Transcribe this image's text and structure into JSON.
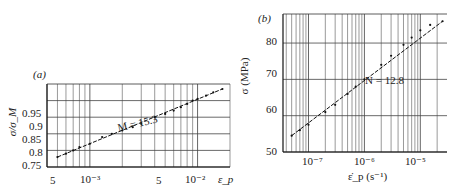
{
  "chart_data": [
    {
      "panel_label": "(a)",
      "type": "scatter",
      "xscale": "log",
      "xlabel": "ε_p",
      "ylabel": "σ/σ_M",
      "xlim": [
        0.0004,
        0.02
      ],
      "ylim": [
        0.75,
        1.0
      ],
      "xtick_labels": [
        "5",
        "10⁻³",
        "5",
        "10⁻²"
      ],
      "xtick_values": [
        0.0005,
        0.001,
        0.005,
        0.01
      ],
      "ytick_labels": [
        "0.75",
        "0.8",
        "0.85",
        "0.9",
        "0.95"
      ],
      "ytick_values": [
        0.75,
        0.8,
        0.85,
        0.9,
        0.95
      ],
      "grid": true,
      "annotation": "M = 15.3",
      "fit_line": {
        "x": [
          0.0005,
          0.017
        ],
        "y": [
          0.78,
          0.985
        ]
      },
      "series": [
        {
          "name": "data",
          "note": "approximate, sampled along fitted line at ~±0.01 precision",
          "x": [
            0.0005,
            0.0006,
            0.0007,
            0.0008,
            0.001,
            0.0013,
            0.0016,
            0.002,
            0.0025,
            0.003,
            0.004,
            0.005,
            0.006,
            0.007,
            0.008,
            0.009,
            0.01,
            0.012,
            0.014,
            0.017
          ],
          "y": [
            0.78,
            0.79,
            0.8,
            0.81,
            0.82,
            0.84,
            0.85,
            0.86,
            0.87,
            0.88,
            0.9,
            0.91,
            0.92,
            0.93,
            0.94,
            0.95,
            0.955,
            0.965,
            0.975,
            0.985
          ]
        }
      ]
    },
    {
      "panel_label": "(b)",
      "type": "scatter",
      "xscale": "log",
      "xlabel": "ε̇_p (s⁻¹)",
      "ylabel": "σ (MPa)",
      "xlim": [
        3.5e-08,
        3e-05
      ],
      "ylim": [
        50,
        88
      ],
      "xtick_labels": [
        "10⁻⁷",
        "10⁻⁶",
        "10⁻⁵"
      ],
      "xtick_values": [
        1e-07,
        1e-06,
        1e-05
      ],
      "ytick_labels": [
        "50",
        "60",
        "70",
        "80"
      ],
      "ytick_values": [
        50,
        60,
        70,
        80
      ],
      "grid": true,
      "annotation": "N = 12.8",
      "fit_line": {
        "x": [
          5e-08,
          2.5e-05
        ],
        "y": [
          54.5,
          86
        ]
      },
      "series": [
        {
          "name": "data",
          "note": "approximate, sampled along fitted line at ~±1 MPa precision",
          "x": [
            5e-08,
            7e-08,
            1e-07,
            2e-07,
            3e-07,
            5e-07,
            7e-07,
            1e-06,
            2e-06,
            3e-06,
            5e-06,
            7e-06,
            1e-05,
            1.5e-05,
            2.5e-05
          ],
          "y": [
            54.5,
            56,
            57.5,
            61,
            63,
            66,
            68,
            70,
            74,
            76.5,
            79.5,
            81.5,
            83.5,
            85,
            86
          ]
        }
      ]
    }
  ],
  "labels": {
    "a": {
      "panel": "(a)",
      "ylabel": "σ/σ_M",
      "xlabel": "ε_p",
      "annotation": "M = 15.3",
      "yticks": [
        "0.95",
        "0.9",
        "0.85",
        "0.8",
        "0.75"
      ],
      "xticks": [
        "5",
        "10⁻³",
        "5",
        "10⁻²"
      ]
    },
    "b": {
      "panel": "(b)",
      "ylabel": "σ (MPa)",
      "xlabel": "ε̇_p (s⁻¹)",
      "annotation": "N = 12.8",
      "yticks": [
        "80",
        "70",
        "60",
        "50"
      ],
      "xticks": [
        "10⁻⁷",
        "10⁻⁶",
        "10⁻⁵"
      ]
    }
  }
}
